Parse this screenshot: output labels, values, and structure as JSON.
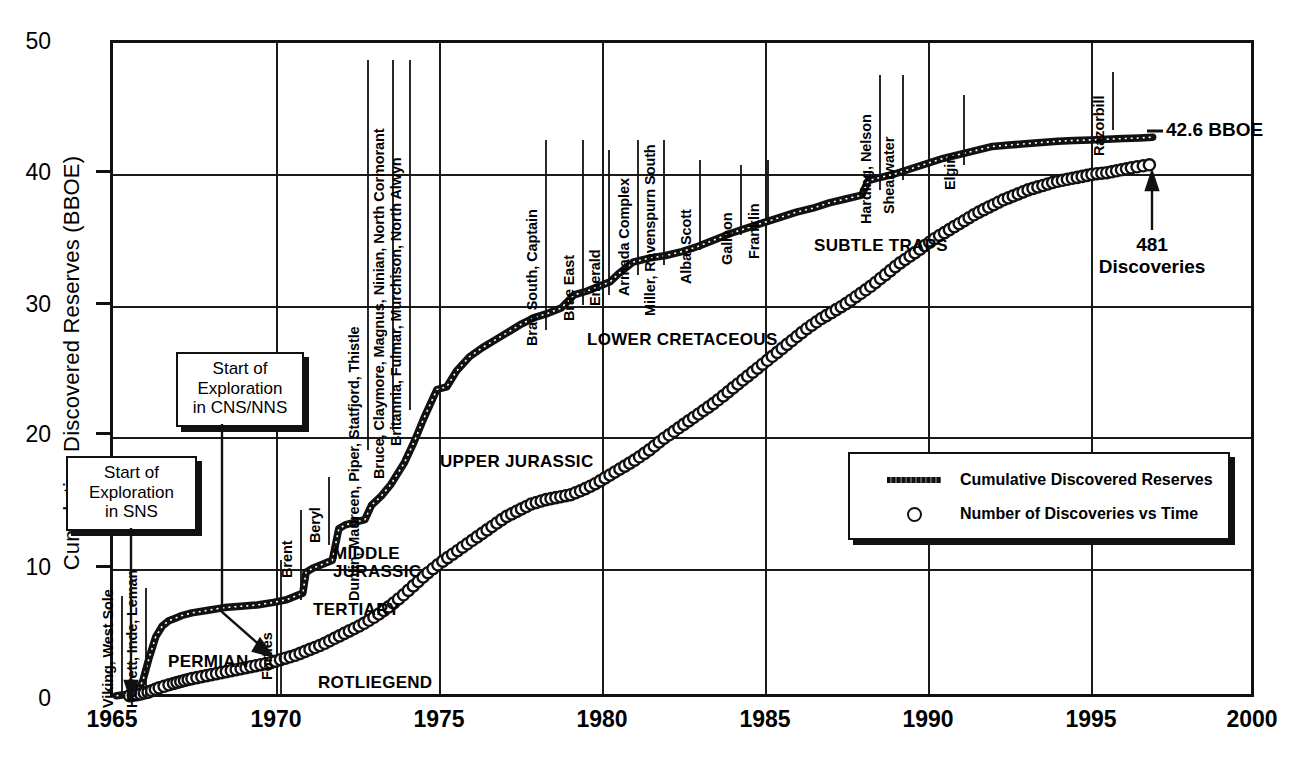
{
  "chart_data": {
    "type": "line",
    "title": "",
    "xlabel": "",
    "ylabel": "Cumulative Discovered Reserves (BBOE)",
    "xlim": [
      1965,
      2000
    ],
    "ylim": [
      0,
      50
    ],
    "xticks": [
      1965,
      1970,
      1975,
      1980,
      1985,
      1990,
      1995,
      2000
    ],
    "yticks": [
      0,
      10,
      20,
      30,
      40,
      50
    ],
    "grid": true,
    "legend_position": "inside-right",
    "series": [
      {
        "name": "Cumulative Discovered Reserves",
        "style": "stippled-thick-line",
        "units": "BBOE",
        "x": [
          1965.2,
          1965.8,
          1966.0,
          1966.2,
          1966.4,
          1966.6,
          1966.8,
          1967.0,
          1967.2,
          1967.5,
          1968.0,
          1968.5,
          1969.0,
          1969.5,
          1970.0,
          1970.4,
          1970.7,
          1970.9,
          1971.0,
          1971.2,
          1971.5,
          1971.8,
          1972.0,
          1972.2,
          1972.5,
          1972.8,
          1973.0,
          1973.3,
          1973.6,
          1974.0,
          1974.3,
          1974.6,
          1975.0,
          1975.3,
          1975.6,
          1976.0,
          1976.4,
          1976.8,
          1977.2,
          1977.6,
          1978.0,
          1978.4,
          1978.8,
          1979.2,
          1979.6,
          1980.0,
          1980.3,
          1980.6,
          1981.0,
          1981.5,
          1982.0,
          1982.5,
          1983.0,
          1983.5,
          1984.0,
          1984.5,
          1985.0,
          1985.5,
          1986.0,
          1986.5,
          1987.0,
          1987.5,
          1988.0,
          1988.2,
          1988.5,
          1989.0,
          1989.5,
          1990.0,
          1990.5,
          1991.0,
          1991.5,
          1992.0,
          1992.5,
          1993.0,
          1993.5,
          1994.0,
          1994.5,
          1995.0,
          1995.5,
          1996.0,
          1996.5,
          1996.9
        ],
        "y": [
          0.1,
          0.3,
          1.2,
          3.0,
          4.6,
          5.4,
          5.8,
          6.0,
          6.2,
          6.4,
          6.6,
          6.8,
          6.9,
          7.0,
          7.2,
          7.4,
          7.7,
          7.9,
          9.5,
          9.8,
          10.1,
          10.4,
          12.8,
          13.1,
          13.3,
          13.5,
          14.6,
          15.3,
          16.2,
          17.8,
          19.4,
          21.2,
          23.4,
          23.6,
          24.8,
          25.9,
          26.6,
          27.2,
          27.8,
          28.4,
          28.9,
          29.2,
          29.6,
          30.6,
          30.9,
          31.3,
          31.6,
          32.3,
          33.1,
          33.4,
          33.6,
          33.9,
          34.3,
          34.8,
          35.3,
          35.7,
          36.1,
          36.5,
          36.9,
          37.2,
          37.6,
          37.9,
          38.2,
          39.3,
          39.5,
          39.8,
          40.2,
          40.6,
          41.0,
          41.3,
          41.6,
          41.9,
          42.0,
          42.1,
          42.2,
          42.3,
          42.35,
          42.4,
          42.45,
          42.5,
          42.55,
          42.6
        ],
        "final_value": 42.6,
        "final_label": "42.6 BBOE"
      },
      {
        "name": "Number of Discoveries vs Time",
        "style": "open-circles",
        "units": "count (plotted on same 0-50 scale, ×10)",
        "x": [
          1965.6,
          1965.9,
          1966.2,
          1966.5,
          1966.9,
          1967.2,
          1967.5,
          1967.9,
          1968.3,
          1968.7,
          1969.1,
          1969.5,
          1969.9,
          1970.3,
          1970.7,
          1971.1,
          1971.5,
          1971.9,
          1972.3,
          1972.7,
          1973.1,
          1973.5,
          1973.9,
          1974.3,
          1974.7,
          1975.1,
          1975.5,
          1975.9,
          1976.3,
          1976.7,
          1977.1,
          1977.5,
          1977.9,
          1978.3,
          1978.7,
          1979.1,
          1979.5,
          1979.9,
          1980.3,
          1980.7,
          1981.1,
          1981.5,
          1981.9,
          1982.3,
          1982.7,
          1983.1,
          1983.5,
          1983.9,
          1984.3,
          1984.7,
          1985.1,
          1985.5,
          1985.9,
          1986.3,
          1986.7,
          1987.1,
          1987.5,
          1987.9,
          1988.3,
          1988.7,
          1989.1,
          1989.5,
          1989.9,
          1990.3,
          1990.7,
          1991.1,
          1991.5,
          1991.9,
          1992.3,
          1992.7,
          1993.1,
          1993.5,
          1993.9,
          1994.3,
          1994.7,
          1995.1,
          1995.5,
          1995.9,
          1996.3,
          1996.8
        ],
        "y": [
          0.1,
          0.2,
          0.4,
          0.7,
          1.0,
          1.2,
          1.4,
          1.6,
          1.8,
          2.0,
          2.2,
          2.4,
          2.6,
          2.9,
          3.2,
          3.6,
          4.0,
          4.5,
          5.0,
          5.5,
          6.1,
          6.8,
          7.6,
          8.5,
          9.4,
          10.2,
          10.9,
          11.6,
          12.3,
          13.0,
          13.7,
          14.2,
          14.7,
          15.0,
          15.2,
          15.4,
          15.8,
          16.3,
          16.9,
          17.5,
          18.1,
          18.8,
          19.6,
          20.3,
          21.0,
          21.7,
          22.4,
          23.2,
          24.0,
          24.8,
          25.6,
          26.4,
          27.2,
          28.0,
          28.7,
          29.3,
          29.9,
          30.6,
          31.3,
          32.1,
          32.9,
          33.6,
          34.3,
          35.0,
          35.6,
          36.2,
          36.8,
          37.3,
          37.8,
          38.2,
          38.6,
          38.9,
          39.2,
          39.4,
          39.6,
          39.8,
          39.9,
          40.1,
          40.3,
          40.5
        ],
        "final_value": 481,
        "final_label": "481 Discoveries"
      }
    ],
    "discovery_labels": [
      {
        "text": "Viking, West Sole",
        "year": 1965.4
      },
      {
        "text": "Hewett, Inde, Leman",
        "year": 1966.2
      },
      {
        "text": "Forties",
        "year": 1970.9
      },
      {
        "text": "Brent",
        "year": 1971.6
      },
      {
        "text": "Beryl",
        "year": 1972.5
      },
      {
        "text": "Dunlin, Maureen, Piper, Statfjord, Thistle",
        "year": 1973.6
      },
      {
        "text": "Bruce, Claymore, Magnus, Ninian, North Cormorant",
        "year": 1974.5
      },
      {
        "text": "Britannia, Fulmar, Murchison, North Alwyn",
        "year": 1975.2
      },
      {
        "text": "Brae South, Captain",
        "year": 1978.8
      },
      {
        "text": "Brae East",
        "year": 1980.0
      },
      {
        "text": "Emerald",
        "year": 1980.8
      },
      {
        "text": "Armada Complex",
        "year": 1981.8
      },
      {
        "text": "Miller, Ravenspurn South",
        "year": 1982.6
      },
      {
        "text": "Alba, Scott",
        "year": 1983.7
      },
      {
        "text": "Galleon",
        "year": 1985.0
      },
      {
        "text": "Franklin",
        "year": 1985.9
      },
      {
        "text": "Harding, Nelson",
        "year": 1888.4
      },
      {
        "text": "Shearwater",
        "year": 1889.2
      },
      {
        "text": "Elgin",
        "year": 1991.6
      },
      {
        "text": "Razorbill",
        "year": 1995.0
      }
    ],
    "play_labels": [
      "PERMIAN",
      "ROTLIEGEND",
      "TERTIARY",
      "MIDDLE JURASSIC",
      "UPPER JURASSIC",
      "LOWER CRETACEOUS",
      "SUBTLE TRAPS"
    ],
    "callouts": [
      "Start of Exploration in SNS",
      "Start of Exploration in CNS/NNS"
    ]
  },
  "axis": {
    "ylabel": "Cumulative Discovered Reserves (BBOE)",
    "yticks": [
      "50",
      "40",
      "30",
      "20",
      "10",
      "0"
    ],
    "xticks": [
      "1965",
      "1970",
      "1975",
      "1980",
      "1985",
      "1990",
      "1995",
      "2000"
    ]
  },
  "callout_sns": {
    "line1": "Start of",
    "line2": "Exploration",
    "line3": "in SNS"
  },
  "callout_cns": {
    "line1": "Start of",
    "line2": "Exploration",
    "line3": "in CNS/NNS"
  },
  "vlabels": {
    "viking": "Viking, West Sole",
    "hewett": "Hewett, Inde, Leman",
    "forties": "Forties",
    "brent": "Brent",
    "beryl": "Beryl",
    "dunlin": "Dunlin, Maureen, Piper, Statfjord, Thistle",
    "bruce": "Bruce, Claymore, Magnus, Ninian, North Cormorant",
    "britannia": "Britannia, Fulmar, Murchison, North Alwyn",
    "braesouth": "Brae South, Captain",
    "braeeast": "Brae East",
    "emerald": "Emerald",
    "armada": "Armada Complex",
    "miller": "Miller, Ravenspurn South",
    "alba": "Alba, Scott",
    "galleon": "Galleon",
    "franklin": "Franklin",
    "harding": "Harding, Nelson",
    "shearwater": "Shearwater",
    "elgin": "Elgin",
    "razorbill": "Razorbill"
  },
  "plays": {
    "permian": "PERMIAN",
    "rotliegend": "ROTLIEGEND",
    "tertiary": "TERTIARY",
    "middle_jurassic_1": "MIDDLE",
    "middle_jurassic_2": "JURASSIC",
    "upper_jurassic": "UPPER JURASSIC",
    "lower_cretaceous": "LOWER CRETACEOUS",
    "subtle_traps": "SUBTLE TRAPS"
  },
  "annotations": {
    "bboe_total": "42.6 BBOE",
    "discoveries_count": "481",
    "discoveries_word": "Discoveries"
  },
  "legend": {
    "reserves": "Cumulative Discovered Reserves",
    "discoveries": "Number of Discoveries vs Time"
  }
}
